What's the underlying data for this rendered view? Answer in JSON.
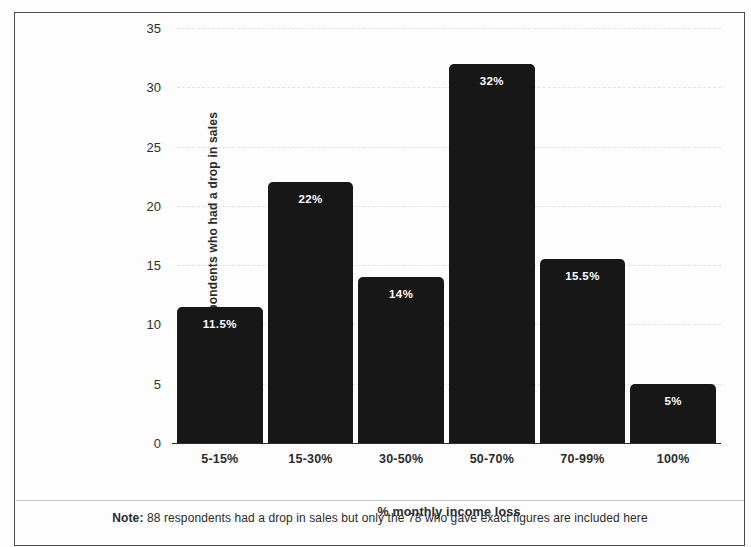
{
  "chart_data": {
    "type": "bar",
    "title": "",
    "categories": [
      "5-15%",
      "15-30%",
      "30-50%",
      "50-70%",
      "70-99%",
      "100%"
    ],
    "values": [
      11.5,
      22,
      14,
      32,
      15.5,
      5
    ],
    "value_labels": [
      "11.5%",
      "22%",
      "14%",
      "32%",
      "15.5%",
      "5%"
    ],
    "xlabel": "% monthly income loss",
    "ylabel": "% of respondents who had a drop in sales",
    "ylim": [
      0,
      35
    ],
    "yticks": [
      0,
      5,
      10,
      15,
      20,
      25,
      30,
      35
    ],
    "ytick_labels": [
      "0",
      "5",
      "10",
      "15",
      "20",
      "25",
      "30",
      "35"
    ],
    "grid": true,
    "grid_axis": "y",
    "legend": false,
    "bar_color": "#171717",
    "bar_label_color": "#ffffff",
    "gridline_color": "#e3e3e3",
    "axis_color": "#2b2b2b"
  },
  "note": {
    "prefix": "Note:",
    "text": " 88 respondents had a drop in sales but only the 78 who gave exact figures are included here"
  }
}
